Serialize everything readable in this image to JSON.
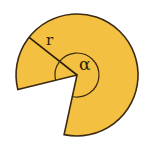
{
  "diagram": {
    "type": "circular-sector",
    "labels": {
      "radius": "r",
      "angle": "α"
    },
    "colors": {
      "fill": "#F4C041",
      "stroke": "#3a2a12",
      "background": "#ffffff"
    }
  }
}
